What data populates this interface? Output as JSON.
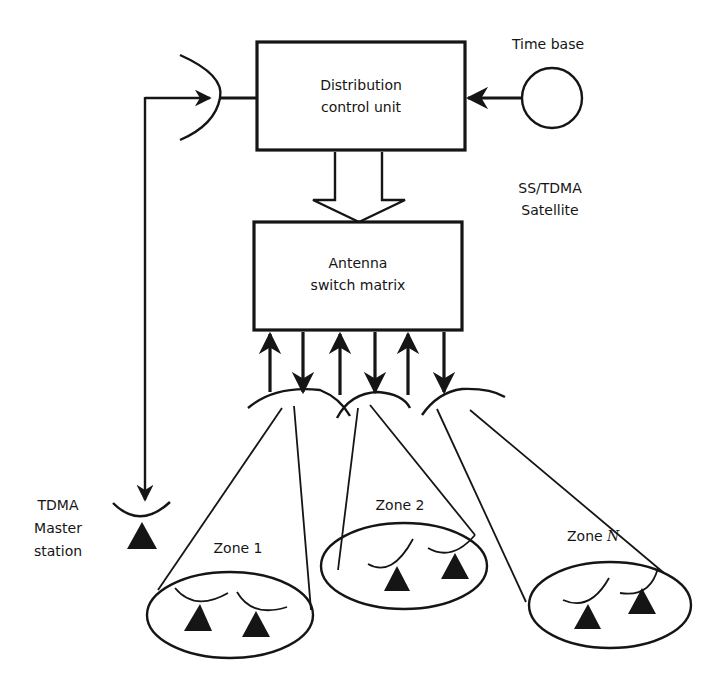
{
  "diagram": {
    "satellite_label": [
      "SS/TDMA",
      "Satellite"
    ],
    "time_base": {
      "label": "Time base"
    },
    "distribution_control_unit": {
      "label": [
        "Distribution",
        "control unit"
      ]
    },
    "antenna_switch_matrix": {
      "label": [
        "Antenna",
        "switch matrix"
      ]
    },
    "master_station": {
      "label": [
        "TDMA",
        "Master",
        "station"
      ]
    },
    "zones": [
      {
        "label": "Zone 1",
        "stations": 2
      },
      {
        "label": "Zone 2",
        "stations": 2
      },
      {
        "label": "Zone ",
        "label_italic": "N",
        "stations": 2
      }
    ],
    "connections": [
      {
        "from": "Time base",
        "to": "Distribution control unit",
        "direction": "into DCU"
      },
      {
        "from": "Satellite dish",
        "to": "Distribution control unit",
        "direction": "link"
      },
      {
        "from": "TDMA Master station",
        "to": "Satellite dish",
        "direction": "up"
      },
      {
        "from": "Satellite dish",
        "to": "TDMA Master station",
        "direction": "down"
      },
      {
        "from": "Distribution control unit",
        "to": "Antenna switch matrix",
        "direction": "block arrow down"
      },
      {
        "from": "Zone antennas",
        "to": "Antenna switch matrix",
        "direction": "up/down pairs x3"
      }
    ]
  }
}
